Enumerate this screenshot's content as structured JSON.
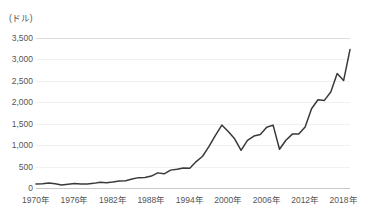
{
  "chart_data": {
    "type": "line",
    "title": "",
    "subtitle": "",
    "unit_label": "(ドル)",
    "xlabel": "",
    "ylabel": "",
    "grid": true,
    "legend": "none",
    "xlim": [
      1970,
      2019
    ],
    "ylim": [
      0,
      3500
    ],
    "y_ticks": [
      0,
      500,
      1000,
      1500,
      2000,
      2500,
      3000,
      3500
    ],
    "y_tick_labels": [
      "0",
      "500",
      "1,000",
      "1,500",
      "2,000",
      "2,500",
      "3,000",
      "3,500"
    ],
    "x_ticks": [
      1970,
      1976,
      1982,
      1988,
      1994,
      2000,
      2006,
      2012,
      2018
    ],
    "x_tick_labels": [
      "1970年",
      "1976年",
      "1982年",
      "1988年",
      "1994年",
      "2000年",
      "2006年",
      "2012年",
      "2018年"
    ],
    "line_color": "#3a3a3a",
    "grid_color": "#f1f1f1",
    "axis_color": "#c9c9c9",
    "series": [
      {
        "name": "index",
        "x": [
          1970,
          1971,
          1972,
          1973,
          1974,
          1975,
          1976,
          1977,
          1978,
          1979,
          1980,
          1981,
          1982,
          1983,
          1984,
          1985,
          1986,
          1987,
          1988,
          1989,
          1990,
          1991,
          1992,
          1993,
          1994,
          1995,
          1996,
          1997,
          1998,
          1999,
          2000,
          2001,
          2002,
          2003,
          2004,
          2005,
          2006,
          2007,
          2008,
          2009,
          2010,
          2011,
          2012,
          2013,
          2014,
          2015,
          2016,
          2017,
          2018,
          2019
        ],
        "values": [
          92,
          102,
          118,
          98,
          69,
          90,
          107,
          95,
          96,
          108,
          136,
          123,
          141,
          165,
          167,
          211,
          242,
          247,
          278,
          353,
          330,
          417,
          436,
          466,
          459,
          616,
          741,
          970,
          1229,
          1469,
          1320,
          1148,
          880,
          1112,
          1212,
          1248,
          1418,
          1468,
          903,
          1115,
          1258,
          1258,
          1426,
          1848,
          2059,
          2044,
          2239,
          2674,
          2507,
          3231
        ]
      }
    ],
    "annotations": []
  }
}
